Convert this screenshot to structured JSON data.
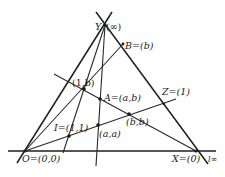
{
  "diagram": {
    "type": "projective-coordinate-construction",
    "labels": {
      "Y": "Y",
      "Y_coord": "(∞)",
      "B": "B=(b)",
      "one_b": "(1,b)",
      "A": "A=(a,b)",
      "Z": "Z=(1)",
      "I": "I=(1,1)",
      "a_a": "(a,a)",
      "b_b": "(b,b)",
      "O": "O=(0,0)",
      "X": "X=(0)",
      "l_inf": "l∞"
    },
    "points": [
      {
        "id": "Y",
        "x": 105,
        "y": 25
      },
      {
        "id": "B",
        "x": 123,
        "y": 44
      },
      {
        "id": "one_b",
        "x": 84,
        "y": 89
      },
      {
        "id": "A",
        "x": 100,
        "y": 99
      },
      {
        "id": "b_b",
        "x": 129,
        "y": 114
      },
      {
        "id": "a_a",
        "x": 98,
        "y": 125
      },
      {
        "id": "I",
        "x": 69,
        "y": 136
      },
      {
        "id": "Z",
        "x": 164,
        "y": 104
      },
      {
        "id": "O",
        "x": 25,
        "y": 151
      },
      {
        "id": "X",
        "x": 196,
        "y": 151
      }
    ],
    "lines": [
      {
        "id": "OY",
        "from": [
          17,
          163
        ],
        "to": [
          112,
          12
        ]
      },
      {
        "id": "YX_linf",
        "from": [
          96,
          12
        ],
        "to": [
          208,
          164
        ]
      },
      {
        "id": "OX",
        "from": [
          8,
          151
        ],
        "to": [
          216,
          151
        ]
      },
      {
        "id": "OB",
        "from": [
          25,
          151
        ],
        "to": [
          123,
          44
        ]
      },
      {
        "id": "OZ",
        "from": [
          25,
          151
        ],
        "to": [
          176,
          99
        ]
      },
      {
        "id": "YI",
        "from": [
          105,
          25
        ],
        "to": [
          63,
          153
        ]
      },
      {
        "id": "YA",
        "from": [
          105,
          25
        ],
        "to": [
          96,
          166
        ]
      },
      {
        "id": "oneb_X",
        "from": [
          54,
          74
        ],
        "to": [
          196,
          151
        ]
      }
    ]
  }
}
